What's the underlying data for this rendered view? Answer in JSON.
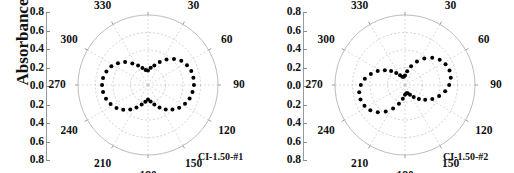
{
  "figure": {
    "axis_label": "Absorbance",
    "background_color": "#ffffff",
    "ink_color": "#111111",
    "grid_color": "#b4b4b4",
    "marker_color": "#000000"
  },
  "panels": [
    {
      "caption": "CI-1.50-#1",
      "radial_ticks": [
        "0.8",
        "0.6",
        "0.4",
        "0.2",
        "0.0",
        "0.2",
        "0.4",
        "0.6",
        "0.8"
      ],
      "angle_ticks": [
        "0",
        "30",
        "60",
        "90",
        "120",
        "150",
        "180",
        "210",
        "240",
        "270",
        "300",
        "330"
      ]
    },
    {
      "caption": "CI-1.50-#2",
      "radial_ticks": [
        "0.8",
        "0.6",
        "0.4",
        "0.2",
        "0.0",
        "0.2",
        "0.4",
        "0.6",
        "0.8"
      ],
      "angle_ticks": [
        "0",
        "30",
        "60",
        "90",
        "120",
        "150",
        "180",
        "210",
        "240",
        "270",
        "300",
        "330"
      ]
    }
  ],
  "chart_data": [
    {
      "type": "line",
      "subtype": "polar-scatter",
      "title": "CI-1.50-#1",
      "xlabel": "",
      "ylabel": "Absorbance",
      "rlim": [
        0,
        0.8
      ],
      "rticks": [
        0.0,
        0.2,
        0.4,
        0.6,
        0.8
      ],
      "rtick_labels_mirrored": [
        "0.8",
        "0.6",
        "0.4",
        "0.2",
        "0.0",
        "0.2",
        "0.4",
        "0.6",
        "0.8"
      ],
      "theta_ticks_deg": [
        0,
        30,
        60,
        90,
        120,
        150,
        180,
        210,
        240,
        270,
        300,
        330
      ],
      "theta_zero_location": "N",
      "theta_direction": "clockwise",
      "grid": true,
      "legend": "none",
      "marker": "filled-circle",
      "annotation": "CI-1.50-#1",
      "theta_deg": [
        0,
        9,
        18,
        27,
        36,
        45,
        54,
        63,
        72,
        81,
        90,
        99,
        108,
        117,
        126,
        135,
        144,
        153,
        162,
        171,
        180,
        189,
        198,
        207,
        216,
        225,
        234,
        243,
        252,
        261,
        270,
        279,
        288,
        297,
        306,
        315,
        324,
        333,
        342,
        351
      ],
      "r": [
        0.165,
        0.2,
        0.235,
        0.295,
        0.36,
        0.42,
        0.47,
        0.5,
        0.52,
        0.525,
        0.525,
        0.515,
        0.5,
        0.475,
        0.44,
        0.395,
        0.345,
        0.29,
        0.235,
        0.19,
        0.165,
        0.195,
        0.235,
        0.29,
        0.345,
        0.4,
        0.445,
        0.48,
        0.505,
        0.52,
        0.525,
        0.52,
        0.5,
        0.47,
        0.425,
        0.37,
        0.305,
        0.25,
        0.205,
        0.175
      ]
    },
    {
      "type": "line",
      "subtype": "polar-scatter",
      "title": "CI-1.50-#2",
      "xlabel": "",
      "ylabel": "Absorbance",
      "rlim": [
        0,
        0.8
      ],
      "rticks": [
        0.0,
        0.2,
        0.4,
        0.6,
        0.8
      ],
      "rtick_labels_mirrored": [
        "0.8",
        "0.6",
        "0.4",
        "0.2",
        "0.0",
        "0.2",
        "0.4",
        "0.6",
        "0.8"
      ],
      "theta_ticks_deg": [
        0,
        30,
        60,
        90,
        120,
        150,
        180,
        210,
        240,
        270,
        300,
        330
      ],
      "theta_zero_location": "N",
      "theta_direction": "clockwise",
      "grid": true,
      "legend": "none",
      "marker": "filled-circle",
      "annotation": "CI-1.50-#2",
      "theta_deg": [
        0,
        9,
        18,
        27,
        36,
        45,
        54,
        63,
        72,
        81,
        90,
        99,
        108,
        117,
        126,
        135,
        144,
        153,
        162,
        171,
        180,
        189,
        198,
        207,
        216,
        225,
        234,
        243,
        252,
        261,
        270,
        279,
        288,
        297,
        306,
        315,
        324,
        333,
        342,
        351
      ],
      "r": [
        0.11,
        0.16,
        0.225,
        0.3,
        0.375,
        0.44,
        0.49,
        0.52,
        0.535,
        0.53,
        0.505,
        0.465,
        0.41,
        0.35,
        0.285,
        0.225,
        0.17,
        0.125,
        0.1,
        0.095,
        0.11,
        0.16,
        0.225,
        0.3,
        0.375,
        0.44,
        0.49,
        0.52,
        0.535,
        0.53,
        0.505,
        0.465,
        0.41,
        0.35,
        0.285,
        0.225,
        0.17,
        0.125,
        0.1,
        0.095
      ]
    }
  ]
}
